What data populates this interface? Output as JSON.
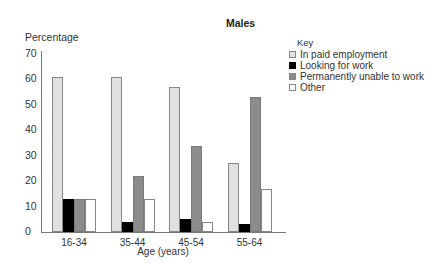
{
  "chart_data": {
    "type": "bar",
    "title": "Males",
    "xlabel": "Age (years)",
    "ylabel": "Percentage",
    "ylim": [
      0,
      70
    ],
    "yticks": [
      0,
      10,
      20,
      30,
      40,
      50,
      60,
      70
    ],
    "grid": false,
    "legend_title": "Key",
    "legend_position": "top-right",
    "categories": [
      "16-34",
      "35-44",
      "45-54",
      "55-64"
    ],
    "series": [
      {
        "name": "In paid employment",
        "color": "#e0e0e0",
        "values": [
          61,
          61,
          57,
          27
        ]
      },
      {
        "name": "Looking for work",
        "color": "#000000",
        "values": [
          13,
          4,
          5,
          3
        ]
      },
      {
        "name": "Permanently unable to work",
        "color": "#8c8c8c",
        "values": [
          13,
          22,
          34,
          53
        ]
      },
      {
        "name": "Other",
        "color": "#ffffff",
        "values": [
          13,
          13,
          4,
          17
        ]
      }
    ]
  }
}
